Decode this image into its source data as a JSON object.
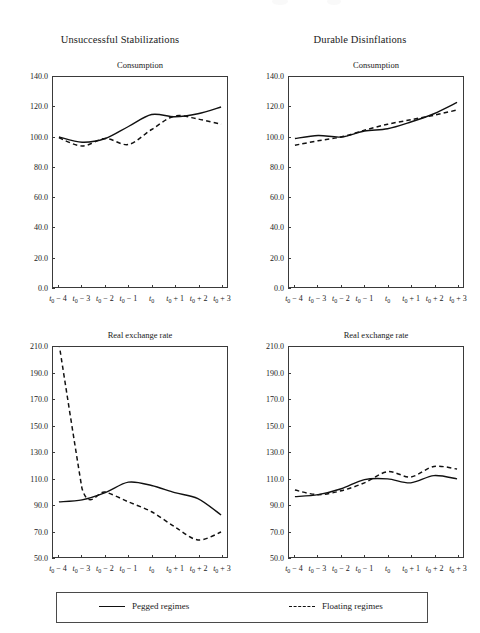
{
  "figure": {
    "width": 480,
    "height": 633,
    "background": "#ffffff",
    "line_color": "#111111"
  },
  "column_titles": [
    {
      "label": "Unsuccessful Stabilizations"
    },
    {
      "label": "Durable Disinflations"
    }
  ],
  "legend": {
    "entries": [
      {
        "label": "Pegged regimes",
        "style": "solid"
      },
      {
        "label": "Floating regimes",
        "style": "dashed"
      }
    ]
  },
  "x_tick_labels": [
    "t₀ − 4",
    "t₀ − 3",
    "t₀ − 2",
    "t₀ − 1",
    "t₀",
    "t₀ + 1",
    "t₀ + 2",
    "t₀ + 3"
  ],
  "chart_data": [
    {
      "id": "unsuccessful-consumption",
      "type": "line",
      "title": "Consumption",
      "group": "Unsuccessful Stabilizations",
      "xlabel": "",
      "ylabel": "",
      "x": [
        "t0-4",
        "t0-3",
        "t0-2",
        "t0-1",
        "t0",
        "t0+1",
        "t0+2",
        "t0+3"
      ],
      "xtick_labels": [
        "t₀ − 4",
        "t₀ − 3",
        "t₀ − 2",
        "t₀ − 1",
        "t₀",
        "t₀ + 1",
        "t₀ + 2",
        "t₀ + 3"
      ],
      "ylim": [
        0.0,
        140.0
      ],
      "ytick_labels": [
        "0.0",
        "20.0",
        "40.0",
        "60.0",
        "80.0",
        "100.0",
        "120.0",
        "140.0"
      ],
      "ytick_values": [
        0.0,
        20.0,
        40.0,
        60.0,
        80.0,
        100.0,
        120.0,
        140.0
      ],
      "grid": false,
      "legend_position": "figure-bottom",
      "series": [
        {
          "name": "Pegged regimes",
          "style": "solid",
          "values": [
            100.0,
            96.5,
            99.0,
            107.0,
            115.0,
            113.5,
            115.5,
            120.0
          ]
        },
        {
          "name": "Floating regimes",
          "style": "dashed",
          "values": [
            99.5,
            94.0,
            99.0,
            95.0,
            105.0,
            114.0,
            112.0,
            108.5
          ]
        }
      ]
    },
    {
      "id": "durable-consumption",
      "type": "line",
      "title": "Consumption",
      "group": "Durable Disinflations",
      "xlabel": "",
      "ylabel": "",
      "x": [
        "t0-4",
        "t0-3",
        "t0-2",
        "t0-1",
        "t0",
        "t0+1",
        "t0+2",
        "t0+3"
      ],
      "xtick_labels": [
        "t₀ − 4",
        "t₀ − 3",
        "t₀ − 2",
        "t₀ − 1",
        "t₀",
        "t₀ + 1",
        "t₀ + 2",
        "t₀ + 3"
      ],
      "ylim": [
        0.0,
        140.0
      ],
      "ytick_labels": [
        "0.0",
        "20.0",
        "40.0",
        "60.0",
        "80.0",
        "100.0",
        "120.0",
        "140.0"
      ],
      "ytick_values": [
        0.0,
        20.0,
        40.0,
        60.0,
        80.0,
        100.0,
        120.0,
        140.0
      ],
      "grid": false,
      "legend_position": "figure-bottom",
      "series": [
        {
          "name": "Pegged regimes",
          "style": "solid",
          "values": [
            99.0,
            101.0,
            100.0,
            104.0,
            105.5,
            110.0,
            115.5,
            123.0
          ]
        },
        {
          "name": "Floating regimes",
          "style": "dashed",
          "values": [
            94.5,
            97.5,
            100.0,
            104.5,
            108.5,
            111.5,
            114.5,
            118.0
          ]
        }
      ]
    },
    {
      "id": "unsuccessful-real-exchange-rate",
      "type": "line",
      "title": "Real exchange rate",
      "group": "Unsuccessful Stabilizations",
      "xlabel": "",
      "ylabel": "",
      "x": [
        "t0-4",
        "t0-3",
        "t0-2",
        "t0-1",
        "t0",
        "t0+1",
        "t0+2",
        "t0+3"
      ],
      "xtick_labels": [
        "t₀ − 4",
        "t₀ − 3",
        "t₀ − 2",
        "t₀ − 1",
        "t₀",
        "t₀ + 1",
        "t₀ + 2",
        "t₀ + 3"
      ],
      "ylim": [
        50.0,
        210.0
      ],
      "ytick_labels": [
        "50.0",
        "70.0",
        "90.0",
        "110.0",
        "130.0",
        "150.0",
        "170.0",
        "190.0",
        "210.0"
      ],
      "ytick_values": [
        50.0,
        70.0,
        90.0,
        110.0,
        130.0,
        150.0,
        170.0,
        190.0,
        210.0
      ],
      "grid": false,
      "legend_position": "figure-bottom",
      "series": [
        {
          "name": "Pegged regimes",
          "style": "solid",
          "values": [
            92.0,
            93.5,
            99.0,
            107.0,
            104.5,
            99.0,
            94.5,
            82.0
          ]
        },
        {
          "name": "Floating regimes",
          "style": "dashed",
          "values": [
            213.0,
            102.0,
            99.5,
            92.0,
            84.5,
            73.0,
            63.0,
            69.0
          ]
        }
      ]
    },
    {
      "id": "durable-real-exchange-rate",
      "type": "line",
      "title": "Real exchange rate",
      "group": "Durable Disinflations",
      "xlabel": "",
      "ylabel": "",
      "x": [
        "t0-4",
        "t0-3",
        "t0-2",
        "t0-1",
        "t0",
        "t0+1",
        "t0+2",
        "t0+3"
      ],
      "xtick_labels": [
        "t₀ − 4",
        "t₀ − 3",
        "t₀ − 2",
        "t₀ − 1",
        "t₀",
        "t₀ + 1",
        "t₀ + 2",
        "t₀ + 3"
      ],
      "ylim": [
        50.0,
        210.0
      ],
      "ytick_labels": [
        "50.0",
        "70.0",
        "90.0",
        "110.0",
        "130.0",
        "150.0",
        "170.0",
        "190.0",
        "210.0"
      ],
      "ytick_values": [
        50.0,
        70.0,
        90.0,
        110.0,
        130.0,
        150.0,
        170.0,
        190.0,
        210.0
      ],
      "grid": false,
      "legend_position": "figure-bottom",
      "series": [
        {
          "name": "Pegged regimes",
          "style": "solid",
          "values": [
            96.0,
            97.5,
            102.0,
            109.0,
            109.5,
            106.5,
            112.0,
            109.5
          ]
        },
        {
          "name": "Floating regimes",
          "style": "dashed",
          "values": [
            101.0,
            97.5,
            100.5,
            106.5,
            115.0,
            111.0,
            119.0,
            117.0
          ]
        }
      ]
    }
  ]
}
